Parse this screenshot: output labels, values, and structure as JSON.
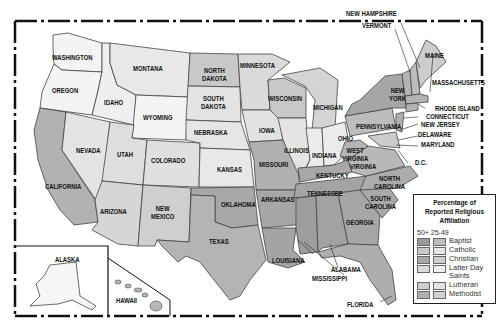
{
  "map": {
    "colors": {
      "background": "#ffffff",
      "state_fill_light": "#f2f2f2",
      "state_fill_mid": "#d9d9d9",
      "state_fill_dark": "#a9a9a9",
      "border": "#444444",
      "frame": "#111111"
    },
    "state_labels": {
      "washington": "WASHINGTON",
      "oregon": "OREGON",
      "california": "CALIFORNIA",
      "nevada": "NEVADA",
      "idaho": "IDAHO",
      "montana": "MONTANA",
      "wyoming": "WYOMING",
      "utah": "UTAH",
      "colorado": "COLORADO",
      "arizona": "ARIZONA",
      "new_mexico": "NEW\nMEXICO",
      "north_dakota": "NORTH\nDAKOTA",
      "south_dakota": "SOUTH\nDAKOTA",
      "nebraska": "NEBRASKA",
      "kansas": "KANSAS",
      "oklahoma": "OKLAHOMA",
      "texas": "TEXAS",
      "minnesota": "MINNESOTA",
      "iowa": "IOWA",
      "missouri": "MISSOURI",
      "arkansas": "ARKANSAS",
      "louisiana": "LOUISIANA",
      "wisconsin": "WISCONSIN",
      "illinois": "ILLINOIS",
      "michigan": "MICHIGAN",
      "indiana": "INDIANA",
      "ohio": "OHIO",
      "kentucky": "KENTUCKY",
      "tennessee": "TENNESSEE",
      "mississippi": "MISSISSIPPI",
      "alabama": "ALABAMA",
      "georgia": "GEORGIA",
      "florida": "FLORIDA",
      "south_carolina": "SOUTH\nCAROLINA",
      "north_carolina": "NORTH\nCAROLINA",
      "virginia": "VIRGINIA",
      "west_virginia": "WEST\nVIRGINIA",
      "pennsylvania": "PENNSYLVANIA",
      "new_york": "NEW\nYORK",
      "vermont": "VERMONT",
      "new_hampshire": "NEW HAMPSHIRE",
      "maine": "MAINE",
      "massachusetts": "MASSACHUSETTS",
      "rhode_island": "RHODE ISLAND",
      "connecticut": "CONNECTICUT",
      "new_jersey": "NEW JERSEY",
      "delaware": "DELAWARE",
      "maryland": "MARYLAND",
      "dc": "D.C.",
      "alaska": "ALASKA",
      "hawaii": "HAWAII"
    }
  },
  "legend": {
    "title": "Percentage of Reported Religious Affiliation",
    "column_header": "50+ 25-49",
    "items": [
      {
        "label": "Baptist",
        "color_high": "#9a9a9a",
        "color_mid": "#bdbdbd"
      },
      {
        "label": "Catholic",
        "color_high": "#c8c8c8",
        "color_mid": "#e6e6e6"
      },
      {
        "label": "Christian",
        "color_high": "#a8a8a8",
        "color_mid": "#cfcfcf"
      },
      {
        "label": "Latter Day Saints",
        "color_high": "#dcdcdc",
        "color_mid": "#efefef"
      },
      {
        "label": "Lutheran",
        "color_high": "#cdcdcd",
        "color_mid": "#e2e2e2"
      },
      {
        "label": "Methodist",
        "color_high": "#b0b0b0",
        "color_mid": "#d2d2d2"
      }
    ]
  }
}
